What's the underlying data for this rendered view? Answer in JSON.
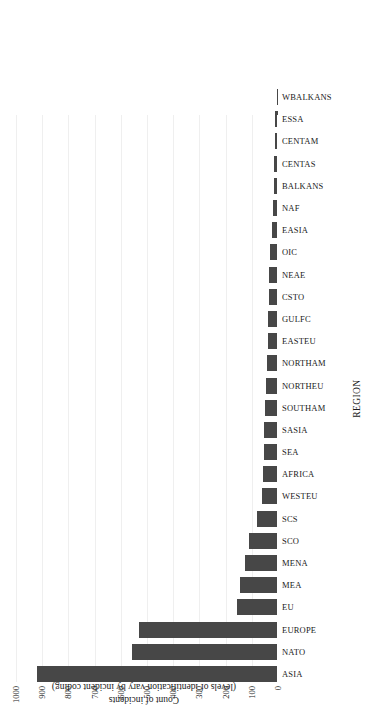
{
  "chart_data": {
    "type": "bar",
    "title": "",
    "subtitle": "",
    "xlabel": "REGION",
    "ylabel": "Count of incidents",
    "ylabel_sub": "(levels of identification vary by incident coding)",
    "orientation": "vertical-bars-rotated-90ccw",
    "grid": true,
    "legend": "none",
    "ylim": [
      0,
      1000
    ],
    "yticks": [
      0,
      100,
      200,
      300,
      400,
      500,
      600,
      700,
      800,
      900,
      1000
    ],
    "ytick_labels": [
      "0",
      "100",
      "200",
      "300",
      "400",
      "500",
      "600",
      "700",
      "800",
      "900",
      "1000"
    ],
    "bar_color": "#474747",
    "grid_color": "#efefef",
    "categories": [
      "ASIA",
      "NATO",
      "EUROPE",
      "EU",
      "MEA",
      "MENA",
      "SCO",
      "SCS",
      "WESTEU",
      "AFRICA",
      "SEA",
      "SASIA",
      "SOUTHAM",
      "NORTHEU",
      "NORTHAM",
      "EASTEU",
      "GULFC",
      "CSTO",
      "NEAE",
      "OIC",
      "EASIA",
      "NAF",
      "BALKANS",
      "CENTAS",
      "CENTAM",
      "ESSA",
      "WBALKANS"
    ],
    "values": [
      920,
      557,
      530,
      155,
      147,
      125,
      110,
      80,
      62,
      58,
      55,
      52,
      48,
      45,
      42,
      40,
      38,
      36,
      34,
      30,
      22,
      18,
      15,
      14,
      13,
      12,
      5
    ]
  },
  "axes": {
    "value_axis_title": "Count of incidents",
    "value_axis_subtitle": "(levels of identification vary by incident coding)",
    "category_axis_title": "REGION"
  }
}
